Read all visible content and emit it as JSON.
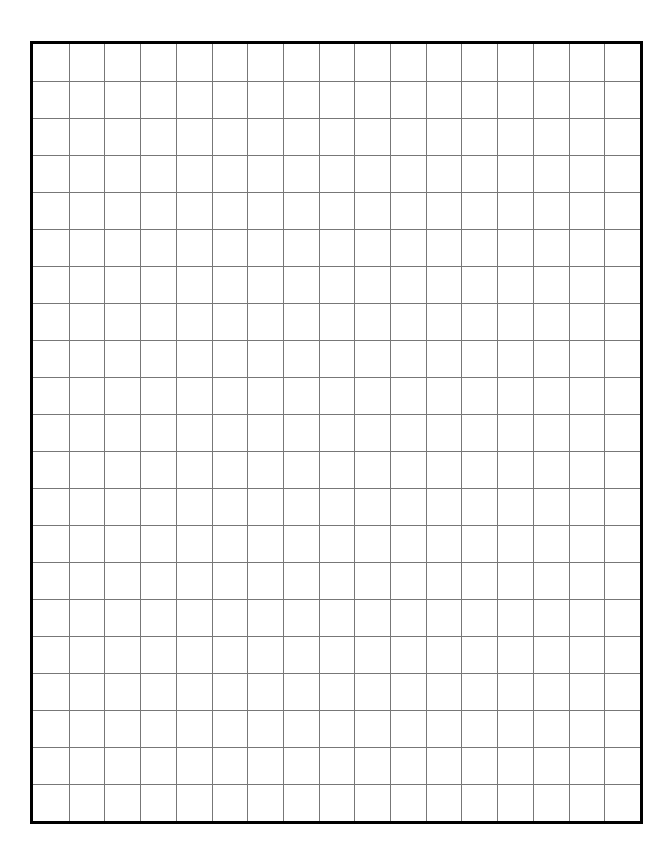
{
  "sheet": {
    "type": "grid-paper",
    "columns": 17,
    "rows": 21,
    "colors": {
      "background": "#ffffff",
      "border": "#000000",
      "grid_line": "#777777"
    },
    "border_width": 3,
    "grid_line_width": 1
  }
}
